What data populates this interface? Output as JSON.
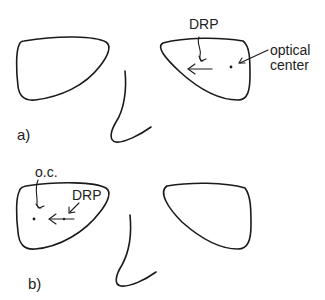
{
  "panel_a": {
    "label": "a)",
    "drp_label": "DRP",
    "optical_center_label_line1": "optical",
    "optical_center_label_line2": "center"
  },
  "panel_b": {
    "label": "b)",
    "oc_label": "o.c.",
    "drp_label": "DRP"
  },
  "colors": {
    "line": "#1a1a1a",
    "background": "#ffffff"
  }
}
